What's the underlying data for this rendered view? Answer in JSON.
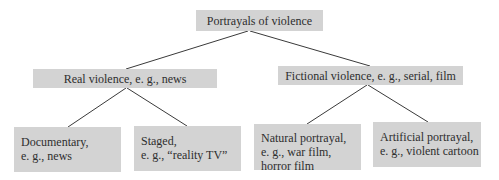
{
  "diagram": {
    "root": {
      "label": "Portrayals of violence"
    },
    "level1": [
      {
        "label": "Real violence, e. g., news",
        "children": [
          {
            "lines": [
              "Documentary,",
              "e. g., news"
            ]
          },
          {
            "lines": [
              "Staged,",
              "e. g., “reality TV”"
            ]
          }
        ]
      },
      {
        "label": "Fictional violence, e. g., serial, film",
        "children": [
          {
            "lines": [
              "Natural portrayal,",
              "e. g., war film,",
              "horror film"
            ]
          },
          {
            "lines": [
              "Artificial portrayal,",
              "e. g., violent cartoon"
            ]
          }
        ]
      }
    ],
    "colors": {
      "box_fill": "#d3d3d3",
      "text": "#2e2e2e",
      "connector": "#3a3a3a"
    }
  }
}
